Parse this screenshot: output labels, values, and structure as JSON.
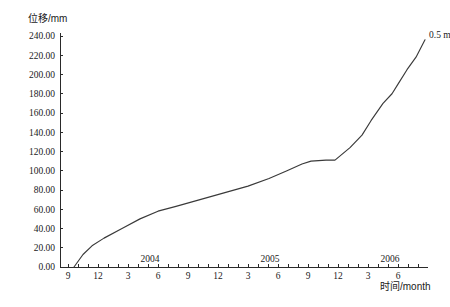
{
  "chart_data": {
    "type": "line",
    "title": "",
    "subtitle": "",
    "ylabel": "位移/mm",
    "xlabel": "时间/month",
    "ylim": [
      0,
      240
    ],
    "ytick_step": 20,
    "grid": false,
    "legend_position": "none",
    "ytick_labels": [
      "0.00",
      "20.00",
      "40.00",
      "60.00",
      "80.00",
      "100.00",
      "120.00",
      "140.00",
      "160.00",
      "180.00",
      "200.00",
      "220.00",
      "240.00"
    ],
    "ytick_values": [
      0,
      20,
      40,
      60,
      80,
      100,
      120,
      140,
      160,
      180,
      200,
      220,
      240
    ],
    "xtick_labels": [
      "9",
      "12",
      "3",
      "6",
      "9",
      "12",
      "3",
      "6",
      "9",
      "12",
      "3",
      "6"
    ],
    "xtick_months": [
      9,
      12,
      3,
      6,
      9,
      12,
      3,
      6,
      9,
      12,
      3,
      6
    ],
    "x_minor_ticks_per_label": 3,
    "year_markers": [
      {
        "label": "2004",
        "at_month_index": 3
      },
      {
        "label": "2005",
        "at_month_index": 7
      },
      {
        "label": "2006",
        "at_month_index": 11
      }
    ],
    "annotations": [
      {
        "text": "0.5 m",
        "at_x_index": 11.3,
        "at_y": 237
      }
    ],
    "series": [
      {
        "name": "0.5 m",
        "points": [
          {
            "x": 0.2,
            "y": 0
          },
          {
            "x": 0.5,
            "y": 13
          },
          {
            "x": 0.8,
            "y": 22
          },
          {
            "x": 1.2,
            "y": 30
          },
          {
            "x": 1.8,
            "y": 40
          },
          {
            "x": 2.4,
            "y": 50
          },
          {
            "x": 3.0,
            "y": 58
          },
          {
            "x": 3.6,
            "y": 63
          },
          {
            "x": 4.4,
            "y": 70
          },
          {
            "x": 5.2,
            "y": 77
          },
          {
            "x": 6.0,
            "y": 84
          },
          {
            "x": 6.7,
            "y": 92
          },
          {
            "x": 7.3,
            "y": 100
          },
          {
            "x": 7.8,
            "y": 107
          },
          {
            "x": 8.1,
            "y": 110
          },
          {
            "x": 8.6,
            "y": 111
          },
          {
            "x": 8.9,
            "y": 111
          },
          {
            "x": 9.4,
            "y": 124
          },
          {
            "x": 9.8,
            "y": 137
          },
          {
            "x": 10.1,
            "y": 152
          },
          {
            "x": 10.5,
            "y": 170
          },
          {
            "x": 10.8,
            "y": 180
          },
          {
            "x": 11.0,
            "y": 190
          },
          {
            "x": 11.3,
            "y": 205
          },
          {
            "x": 11.6,
            "y": 218
          },
          {
            "x": 11.9,
            "y": 236
          }
        ]
      }
    ]
  },
  "axes": {
    "y_axis_title": "位移/mm",
    "x_axis_title": "时间/month"
  }
}
